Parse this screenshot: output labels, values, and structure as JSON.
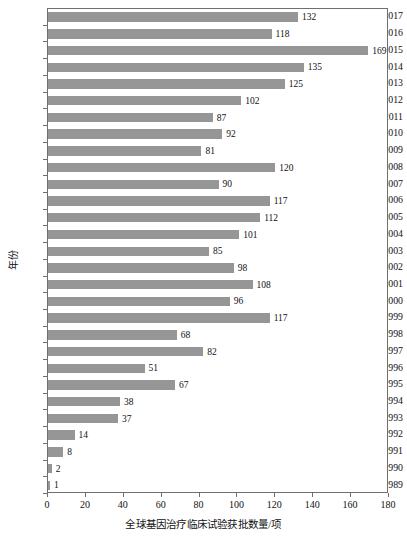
{
  "chart_data": {
    "type": "bar",
    "orientation": "horizontal",
    "title": "",
    "xlabel": "全球基因治疗临床试验获批数量/项",
    "ylabel": "年份",
    "xlim": [
      0,
      180
    ],
    "ylim": null,
    "grid": false,
    "legend": null,
    "bar_color": "#969696",
    "axis_color": "#6f6f6f",
    "xticks": [
      0,
      20,
      40,
      60,
      80,
      100,
      120,
      140,
      160,
      180
    ],
    "xtick_labels": [
      "0",
      "20",
      "40",
      "60",
      "80",
      "100",
      "120",
      "140",
      "160",
      "180"
    ],
    "categories": [
      "2017",
      "2016",
      "2015",
      "2014",
      "2013",
      "2012",
      "2011",
      "2010",
      "2009",
      "2008",
      "2007",
      "2006",
      "2005",
      "2004",
      "2003",
      "2002",
      "2001",
      "2000",
      "1999",
      "1998",
      "1997",
      "1996",
      "1995",
      "1994",
      "1993",
      "1992",
      "1991",
      "1990",
      "1989"
    ],
    "values": [
      132,
      118,
      169,
      135,
      125,
      102,
      87,
      92,
      81,
      120,
      90,
      117,
      112,
      101,
      85,
      98,
      108,
      96,
      117,
      68,
      82,
      51,
      67,
      38,
      37,
      14,
      8,
      2,
      1
    ],
    "data_labels": [
      "132",
      "118",
      "169",
      "135",
      "125",
      "102",
      "87",
      "92",
      "81",
      "120",
      "90",
      "117",
      "112",
      "101",
      "85",
      "98",
      "108",
      "96",
      "117",
      "68",
      "82",
      "51",
      "67",
      "38",
      "37",
      "14",
      "8",
      "2",
      "1"
    ]
  }
}
